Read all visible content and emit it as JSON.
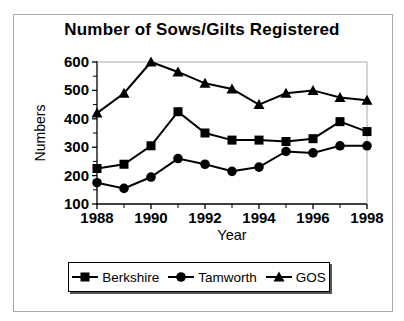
{
  "figure": {
    "background": "#ffffff",
    "border_color": "#aaaaaa",
    "line_color": "#000000"
  },
  "chart_data": {
    "type": "line",
    "title": "Number of Sows/Gilts Registered",
    "xlabel": "Year",
    "ylabel": "Numbers",
    "x": [
      1988,
      1989,
      1990,
      1991,
      1992,
      1993,
      1994,
      1995,
      1996,
      1997,
      1998
    ],
    "x_tick_labels": [
      "1988",
      "1990",
      "1992",
      "1994",
      "1996",
      "1998"
    ],
    "ylim": [
      100,
      600
    ],
    "y_ticks": [
      100,
      200,
      300,
      400,
      500,
      600
    ],
    "y_minor_ticks": [
      150,
      250,
      350,
      450,
      550
    ],
    "grid": false,
    "legend_position": "bottom",
    "series": [
      {
        "name": "Berkshire",
        "marker": "square",
        "color": "#000000",
        "values": [
          225,
          240,
          305,
          425,
          350,
          325,
          325,
          320,
          330,
          390,
          355
        ]
      },
      {
        "name": "Tamworth",
        "marker": "circle",
        "color": "#000000",
        "values": [
          175,
          155,
          195,
          260,
          240,
          215,
          230,
          285,
          280,
          305,
          305
        ]
      },
      {
        "name": "GOS",
        "marker": "triangle",
        "color": "#000000",
        "values": [
          420,
          490,
          600,
          565,
          525,
          505,
          450,
          490,
          500,
          475,
          465
        ]
      }
    ]
  }
}
